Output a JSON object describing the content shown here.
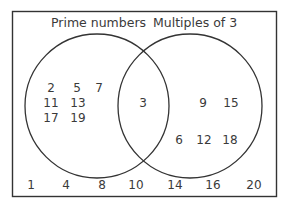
{
  "diagram": {
    "type": "venn",
    "sets": {
      "a": {
        "label": "Prime numbers"
      },
      "b": {
        "label": "Multiples of 3"
      }
    },
    "only_a": [
      "2",
      "5",
      "7",
      "11",
      "13",
      "17",
      "19"
    ],
    "intersection": [
      "3"
    ],
    "only_b": [
      "9",
      "15",
      "6",
      "12",
      "18"
    ],
    "outside": [
      "1",
      "4",
      "8",
      "10",
      "14",
      "16",
      "20"
    ]
  }
}
